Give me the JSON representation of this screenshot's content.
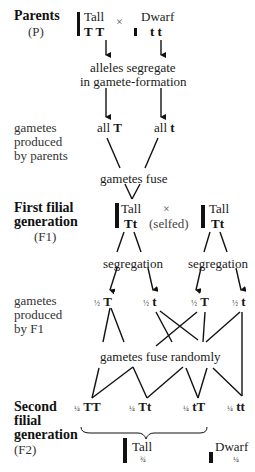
{
  "generations": {
    "parents": {
      "title": "Parents",
      "abbr": "(P)"
    },
    "first": {
      "title_line1": "First filial",
      "title_line2": "generation",
      "abbr": "(F1)"
    },
    "second": {
      "title_line1": "Second",
      "title_line2": "filial",
      "title_line3": "generation",
      "abbr": "(F2)"
    }
  },
  "parents_cross": {
    "left": {
      "phenotype": "Tall",
      "genotype": "T T"
    },
    "cross_symbol": "×",
    "right": {
      "phenotype": "Dwarf",
      "genotype": "t t"
    }
  },
  "segregation_note": {
    "line1": "alleles segregate",
    "line2": "in gamete-formation"
  },
  "parent_gametes": {
    "label_line1": "gametes",
    "label_line2": "produced",
    "label_line3": "by parents",
    "left": {
      "prefix": "all",
      "allele": "T"
    },
    "right": {
      "prefix": "all",
      "allele": "t"
    }
  },
  "fusion_label": "gametes fuse",
  "f1_cross": {
    "left": {
      "phenotype": "Tall",
      "genotype": "Tt"
    },
    "cross_symbol": "×",
    "selfed": "(selfed)",
    "right": {
      "phenotype": "Tall",
      "genotype": "Tt"
    }
  },
  "segregation_labels": [
    "segregation",
    "segregation"
  ],
  "f1_gametes": {
    "label_line1": "gametes",
    "label_line2": "produced",
    "label_line3": "by  F1",
    "items": [
      {
        "fraction": "½",
        "allele": "T"
      },
      {
        "fraction": "½",
        "allele": "t"
      },
      {
        "fraction": "½",
        "allele": "T"
      },
      {
        "fraction": "½",
        "allele": "t"
      }
    ]
  },
  "random_fusion_label": "gametes fuse randomly",
  "f2_genotypes": [
    {
      "fraction": "¼",
      "genotype": "TT"
    },
    {
      "fraction": "¼",
      "genotype": "Tt"
    },
    {
      "fraction": "¼",
      "genotype": "tT"
    },
    {
      "fraction": "¼",
      "genotype": "tt"
    }
  ],
  "f2_phenotypes": {
    "tall": {
      "label": "Tall",
      "fraction": "¾"
    },
    "dwarf": {
      "label": "Dwarf",
      "fraction": "¼"
    }
  }
}
